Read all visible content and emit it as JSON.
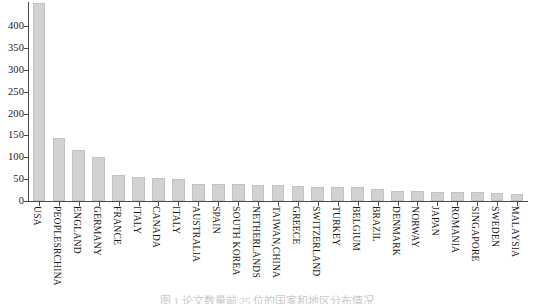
{
  "chart_data": {
    "type": "bar",
    "title": "",
    "xlabel": "",
    "ylabel": "",
    "ylim": [
      0,
      450
    ],
    "grid": false,
    "legend": null,
    "bar_color": "#d2d2d2",
    "axis_color": "#4a4a4a",
    "y_ticks": [
      0,
      50,
      100,
      150,
      200,
      250,
      300,
      350,
      400
    ],
    "y_tick_labels": [
      "0",
      "50",
      "100",
      "150",
      "200",
      "250",
      "300",
      "350",
      "400"
    ],
    "categories": [
      "USA",
      "PEOPLESRCHINA",
      "ENGLAND",
      "GERMANY",
      "FRANCE",
      "ITALY",
      "CANADA",
      "ITALY",
      "AUSTRALIA",
      "SPAIN",
      "SOUTH KOREA",
      "NETHERLANDS",
      "TAIWAN,CHINA",
      "GREECE",
      "SWITZERLAND",
      "TURKEY",
      "BELGIUM",
      "BRAZIL",
      "DENMARK",
      "NORWAY",
      "JAPAN",
      "ROMANIA",
      "SINGAPORE",
      "SWEDEN",
      "MALAYSIA"
    ],
    "values": [
      453,
      143,
      117,
      100,
      60,
      56,
      52,
      50,
      40,
      40,
      38,
      37,
      36,
      34,
      33,
      32,
      31,
      28,
      23,
      22,
      21,
      21,
      20,
      19,
      17
    ]
  },
  "caption": {
    "text": "图 1 论文数量前 25 位的国家和地区分布情况"
  }
}
